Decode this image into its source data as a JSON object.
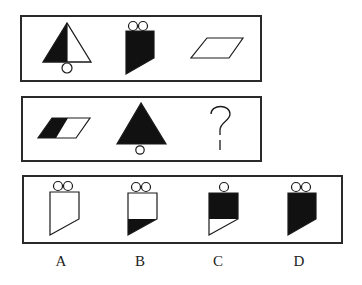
{
  "puzzle": {
    "type": "figure-reasoning",
    "row1": {
      "figures": [
        {
          "name": "triangle-left-half-black-with-circle-below"
        },
        {
          "name": "pentagon-fully-black-with-two-circles-on-top"
        },
        {
          "name": "parallelogram-white"
        }
      ]
    },
    "row2": {
      "figures": [
        {
          "name": "parallelogram-left-half-black"
        },
        {
          "name": "triangle-fully-black-with-circle-below"
        },
        {
          "name": "question-mark"
        }
      ],
      "question_mark": "?"
    },
    "options": [
      {
        "label": "A",
        "name": "pentagon-white-two-circles"
      },
      {
        "label": "B",
        "name": "pentagon-bottom-black-two-circles"
      },
      {
        "label": "C",
        "name": "pentagon-top-black-one-circle"
      },
      {
        "label": "D",
        "name": "pentagon-fully-black-two-circles"
      }
    ]
  },
  "colors": {
    "stroke": "#1a1a1a",
    "fill_black": "#111111",
    "background": "#ffffff"
  }
}
